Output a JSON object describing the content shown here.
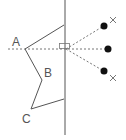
{
  "diagram": {
    "labels": {
      "A": "A",
      "B": "B",
      "C": "C"
    },
    "colors": {
      "line": "#555555",
      "dot": "#111111",
      "dotted": "#777777"
    },
    "mirror": {
      "x": 65,
      "y1": 0,
      "y2": 135
    },
    "shape": {
      "points": [
        [
          64,
          25
        ],
        [
          25,
          49
        ],
        [
          42,
          80
        ],
        [
          31,
          109
        ],
        [
          64,
          99
        ]
      ]
    },
    "dots": [
      [
        104,
        26
      ],
      [
        108,
        49
      ],
      [
        104,
        71
      ]
    ],
    "crosses": [
      [
        113,
        20
      ],
      [
        113,
        78
      ]
    ]
  }
}
